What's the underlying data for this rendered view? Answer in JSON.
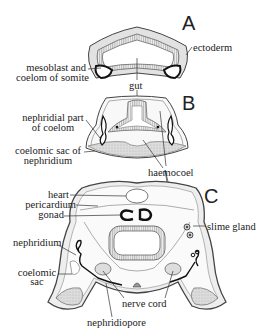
{
  "figure": {
    "panels": [
      {
        "id": "A",
        "letter": "A"
      },
      {
        "id": "B",
        "letter": "B"
      },
      {
        "id": "C",
        "letter": "C"
      }
    ],
    "labels": {
      "ectoderm": "ectoderm",
      "mesoblast_1": "mesoblast and",
      "mesoblast_2": "coelom of somite",
      "gut": "gut",
      "nephridial_1": "nephridial part",
      "nephridial_2": "of coelom",
      "coelomic_sac_neph_1": "coelomic sac of",
      "coelomic_sac_neph_2": "nephridium",
      "haemocoel": "haemocoel",
      "heart": "heart",
      "pericardium": "pericardium",
      "gonad": "gonad",
      "slime_gland": "slime gland",
      "nephridium": "nephridium",
      "coelomic_sac_1": "coelomic",
      "coelomic_sac_2": "sac",
      "nerve_cord": "nerve cord",
      "nephridiopore": "nephridiopore"
    },
    "colors": {
      "outline": "#333333",
      "fill_light": "#e4e4e4",
      "fill_mid": "#cfcfcf",
      "hatch": "#9a9a9a",
      "black": "#111111"
    }
  }
}
